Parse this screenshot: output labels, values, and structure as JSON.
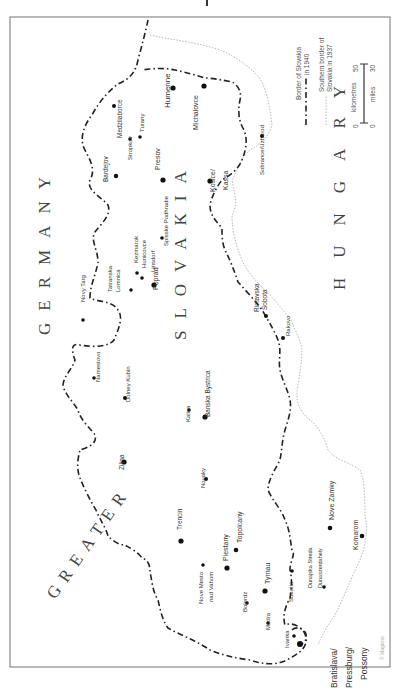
{
  "map": {
    "title": "Slovakia 1940",
    "orientation": "rotated 90° counter-clockwise (text reads bottom-to-top)",
    "colors": {
      "frame": "#8a8a8a",
      "border_1940": "#222222",
      "border_1937": "#b9b9b9",
      "text": "#333333"
    },
    "countries": [
      {
        "label": "GREATER",
        "x": 55,
        "y": 600,
        "size": 17,
        "spacing": 8,
        "rot": -55
      },
      {
        "label": "GERMANY",
        "x": 50,
        "y": 335,
        "size": 17,
        "spacing": 12,
        "rot": -90
      },
      {
        "label": "SLOVAKIA",
        "x": 186,
        "y": 340,
        "size": 17,
        "spacing": 12,
        "rot": -90
      },
      {
        "label": "HUNGARY",
        "x": 345,
        "y": 290,
        "size": 17,
        "spacing": 20,
        "rot": -90
      }
    ],
    "cities": [
      {
        "name": "Bardejov",
        "x": 116,
        "y": 176,
        "dot": 2.2,
        "lx": 108,
        "ly": 182,
        "size": 6.5
      },
      {
        "name": "Medzilaborce",
        "x": 114,
        "y": 106,
        "dot": 2,
        "lx": 122,
        "ly": 138,
        "size": 6.5
      },
      {
        "name": "Stropkov",
        "x": 130,
        "y": 139,
        "dot": 1.8,
        "lx": 132,
        "ly": 160,
        "size": 6
      },
      {
        "name": "Turany",
        "x": 140,
        "y": 137,
        "dot": 1.8,
        "lx": 144,
        "ly": 132,
        "size": 6
      },
      {
        "name": "Humenne",
        "x": 173,
        "y": 88,
        "dot": 2.6,
        "lx": 170,
        "ly": 108,
        "size": 8
      },
      {
        "name": "Presov",
        "x": 163,
        "y": 180,
        "dot": 2.6,
        "lx": 160,
        "ly": 170,
        "size": 7
      },
      {
        "name": "Michalovce",
        "x": 204,
        "y": 86,
        "dot": 2.6,
        "lx": 198,
        "ly": 130,
        "size": 7
      },
      {
        "name": "Kosice/",
        "x": 210,
        "y": 181,
        "dot": 2.6,
        "lx": 215,
        "ly": 192,
        "size": 7
      },
      {
        "name": "Kassa",
        "x": 0,
        "y": 0,
        "dot": 0,
        "lx": 228,
        "ly": 190,
        "size": 7
      },
      {
        "name": "Sobrance/Uzhorod",
        "x": 262,
        "y": 136,
        "dot": 2,
        "lx": 264,
        "ly": 175,
        "size": 6
      },
      {
        "name": "Spisske Podhradie",
        "x": 162,
        "y": 238,
        "dot": 1.8,
        "lx": 168,
        "ly": 246,
        "size": 6
      },
      {
        "name": "Kezmarok",
        "x": 137,
        "y": 273,
        "dot": 1.8,
        "lx": 138,
        "ly": 263,
        "size": 6
      },
      {
        "name": "Hunicovce",
        "x": 142,
        "y": 278,
        "dot": 1.8,
        "lx": 146,
        "ly": 268,
        "size": 6
      },
      {
        "name": "Linsdorf",
        "x": 0,
        "y": 0,
        "dot": 0,
        "lx": 155,
        "ly": 272,
        "size": 6
      },
      {
        "name": "Poprad",
        "x": 154,
        "y": 285,
        "dot": 2.6,
        "lx": 158,
        "ly": 290,
        "size": 7
      },
      {
        "name": "Tatranska",
        "x": 131,
        "y": 290,
        "dot": 1.8,
        "lx": 112,
        "ly": 292,
        "size": 6
      },
      {
        "name": "Lomnica",
        "x": 0,
        "y": 0,
        "dot": 0,
        "lx": 120,
        "ly": 292,
        "size": 6
      },
      {
        "name": "Novy Targ",
        "x": 83,
        "y": 320,
        "dot": 1.8,
        "lx": 85,
        "ly": 302,
        "size": 6
      },
      {
        "name": "Rimavska",
        "x": 0,
        "y": 0,
        "dot": 0,
        "lx": 259,
        "ly": 312,
        "size": 6.5
      },
      {
        "name": "Sobota",
        "x": 266,
        "y": 316,
        "dot": 2,
        "lx": 267,
        "ly": 310,
        "size": 6.5
      },
      {
        "name": "Rakovo",
        "x": 283,
        "y": 338,
        "dot": 2,
        "lx": 290,
        "ly": 336,
        "size": 6
      },
      {
        "name": "Namestovo",
        "x": 94,
        "y": 378,
        "dot": 1.8,
        "lx": 100,
        "ly": 382,
        "size": 6
      },
      {
        "name": "Dolney Kubin",
        "x": 125,
        "y": 398,
        "dot": 2,
        "lx": 130,
        "ly": 402,
        "size": 6
      },
      {
        "name": "Kalisa",
        "x": 189,
        "y": 410,
        "dot": 1.8,
        "lx": 190,
        "ly": 422,
        "size": 6
      },
      {
        "name": "Banska Bystrica",
        "x": 205,
        "y": 417,
        "dot": 2.6,
        "lx": 210,
        "ly": 417,
        "size": 6.5
      },
      {
        "name": "Zilina",
        "x": 124,
        "y": 462,
        "dot": 2.6,
        "lx": 124,
        "ly": 470,
        "size": 6.5
      },
      {
        "name": "Novaky",
        "x": 206,
        "y": 479,
        "dot": 2,
        "lx": 205,
        "ly": 488,
        "size": 6
      },
      {
        "name": "Topolcany",
        "x": 236,
        "y": 550,
        "dot": 2.3,
        "lx": 242,
        "ly": 543,
        "size": 7
      },
      {
        "name": "Nove Zamky",
        "x": 330,
        "y": 528,
        "dot": 2.3,
        "lx": 334,
        "ly": 520,
        "size": 7
      },
      {
        "name": "Komarom",
        "x": 362,
        "y": 536,
        "dot": 2.3,
        "lx": 358,
        "ly": 550,
        "size": 7
      },
      {
        "name": "Trencin",
        "x": 181,
        "y": 541,
        "dot": 2.6,
        "lx": 182,
        "ly": 530,
        "size": 6.5
      },
      {
        "name": "Piestany",
        "x": 227,
        "y": 568,
        "dot": 2.6,
        "lx": 228,
        "ly": 561,
        "size": 7
      },
      {
        "name": "Nove Mesto",
        "x": 203,
        "y": 565,
        "dot": 1.8,
        "lx": 203,
        "ly": 604,
        "size": 6
      },
      {
        "name": "nad Vahom",
        "x": 0,
        "y": 0,
        "dot": 0,
        "lx": 213,
        "ly": 602,
        "size": 6
      },
      {
        "name": "Tyrnau",
        "x": 265,
        "y": 591,
        "dot": 2.6,
        "lx": 270,
        "ly": 584,
        "size": 7
      },
      {
        "name": "Bolerdz",
        "x": 247,
        "y": 603,
        "dot": 1.8,
        "lx": 247,
        "ly": 612,
        "size": 6
      },
      {
        "name": "Sobotia",
        "x": 292,
        "y": 571,
        "dot": 1.8,
        "lx": 293,
        "ly": 602,
        "size": 6
      },
      {
        "name": "Dunajska Streda",
        "x": 324,
        "y": 587,
        "dot": 1.8,
        "lx": 312,
        "ly": 588,
        "size": 5.5
      },
      {
        "name": "Dunaszerdahely",
        "x": 0,
        "y": 0,
        "dot": 0,
        "lx": 322,
        "ly": 588,
        "size": 5.5
      },
      {
        "name": "Modra",
        "x": 268,
        "y": 623,
        "dot": 1.8,
        "lx": 270,
        "ly": 630,
        "size": 6
      },
      {
        "name": "Ivanka",
        "x": 294,
        "y": 636,
        "dot": 1.8,
        "lx": 289,
        "ly": 648,
        "size": 6
      },
      {
        "name": "Bratislava/",
        "x": 300,
        "y": 644,
        "dot": 3,
        "lx": 337,
        "ly": 688,
        "size": 8.5
      },
      {
        "name": "Pressburg/",
        "x": 0,
        "y": 0,
        "dot": 0,
        "lx": 352,
        "ly": 688,
        "size": 8.5
      },
      {
        "name": "Possony",
        "x": 0,
        "y": 0,
        "dot": 0,
        "lx": 367,
        "ly": 680,
        "size": 8.5
      }
    ],
    "legend": {
      "border_1940_label_line1": "Border of Slovakia",
      "border_1940_label_line2": "in 1940",
      "border_1937_label_line1": "Southern border of",
      "border_1937_label_line2": "Slovakia in 1937",
      "scale_km_label": "kilometres",
      "scale_km_start": "0",
      "scale_km_end": "50",
      "scale_mi_label": "miles",
      "scale_mi_start": "0",
      "scale_mi_end": "30"
    },
    "credit": "© Magocsi"
  }
}
